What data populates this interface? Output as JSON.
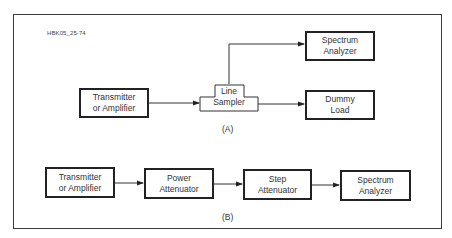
{
  "figure_id": "HBK05_25-74",
  "diagram_a": {
    "caption": "(A)",
    "blocks": {
      "transmitter": "Transmitter\nor Amplifier",
      "line_sampler": "Line\nSampler",
      "spectrum_analyzer": "Spectrum\nAnalyzer",
      "dummy_load": "Dummy\nLoad"
    },
    "connections": [
      [
        "Transmitter or Amplifier",
        "Line Sampler"
      ],
      [
        "Line Sampler",
        "Spectrum Analyzer"
      ],
      [
        "Line Sampler",
        "Dummy Load"
      ]
    ]
  },
  "diagram_b": {
    "caption": "(B)",
    "blocks": {
      "transmitter": "Transmitter\nor Amplifier",
      "power_attenuator": "Power\nAttenuator",
      "step_attenuator": "Step\nAttenuator",
      "spectrum_analyzer": "Spectrum\nAnalyzer"
    },
    "connections": [
      [
        "Transmitter or Amplifier",
        "Power Attenuator"
      ],
      [
        "Power Attenuator",
        "Step Attenuator"
      ],
      [
        "Step Attenuator",
        "Spectrum Analyzer"
      ]
    ]
  }
}
